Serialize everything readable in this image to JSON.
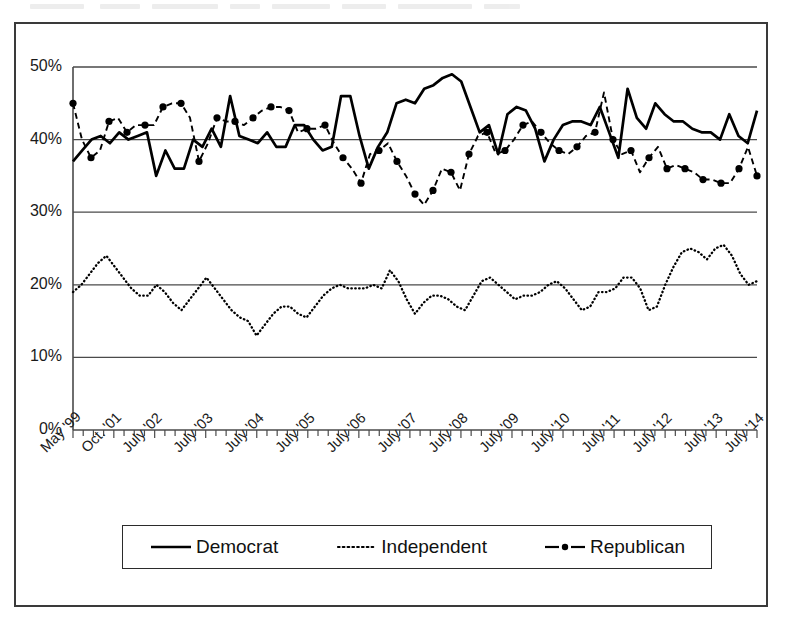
{
  "figure": {
    "frame_color": "#3a3a3a",
    "background": "#ffffff"
  },
  "legend": {
    "position": "bottom",
    "items": [
      {
        "label": "Democrat",
        "style": "solid",
        "marker": "none",
        "color": "#000000",
        "key_name": "legend-key-democrat"
      },
      {
        "label": "Independent",
        "style": "dotted",
        "marker": "none",
        "color": "#000000",
        "key_name": "legend-key-independent"
      },
      {
        "label": "Republican",
        "style": "dashed",
        "marker": "circle",
        "color": "#000000",
        "key_name": "legend-key-republican"
      }
    ]
  },
  "chart_data": {
    "type": "line",
    "title": "",
    "subtitle": "",
    "xlabel": "",
    "ylabel": "",
    "ylim": [
      0,
      50
    ],
    "yticks": [
      0,
      10,
      20,
      30,
      40,
      50
    ],
    "ytick_labels": [
      "0%",
      "10%",
      "20%",
      "30%",
      "40%",
      "50%"
    ],
    "grid": "horizontal",
    "legend_position": "bottom",
    "xtick_labels": [
      "May '99",
      "Oct. '01",
      "July '02",
      "July '03",
      "July '04",
      "July '05",
      "July '06",
      "July '07",
      "July '08",
      "July '09",
      "July '10",
      "July '11",
      "July '12",
      "July '13",
      "July '14"
    ],
    "xtick_indices": [
      0,
      4,
      8,
      13,
      18,
      23,
      28,
      33,
      38,
      43,
      48,
      53,
      58,
      63,
      67
    ],
    "n_points": 68,
    "series": [
      {
        "name": "Democrat",
        "style": "solid",
        "marker": "none",
        "values": [
          37.0,
          38.5,
          40.0,
          40.5,
          39.5,
          41.0,
          40.0,
          40.5,
          41.0,
          35.0,
          38.5,
          36.0,
          36.0,
          40.0,
          39.0,
          41.5,
          39.0,
          46.0,
          40.5,
          40.0,
          39.5,
          41.0,
          39.0,
          39.0,
          42.0,
          42.0,
          40.0,
          38.5,
          39.0,
          46.0,
          46.0,
          40.5,
          36.0,
          39.0,
          41.0,
          45.0,
          45.5,
          45.0,
          47.0,
          47.5,
          48.5,
          49.0,
          48.0,
          44.5,
          41.0,
          42.0,
          38.0,
          43.5,
          44.5,
          44.0,
          41.5,
          37.0,
          40.0,
          42.0,
          42.5,
          42.5,
          42.0,
          44.5,
          41.0,
          37.5,
          47.0,
          43.0,
          41.5,
          45.0,
          43.5,
          42.5,
          42.5,
          41.5,
          41.0,
          41.0,
          40.0,
          43.5,
          40.5,
          39.5,
          44.0
        ]
      },
      {
        "name": "Independent",
        "style": "dotted",
        "marker": "none",
        "values": [
          19.0,
          20.0,
          21.5,
          23.0,
          24.0,
          22.5,
          21.0,
          19.5,
          18.5,
          18.5,
          20.0,
          19.0,
          17.5,
          16.5,
          18.0,
          19.5,
          21.0,
          19.5,
          18.0,
          16.5,
          15.5,
          15.0,
          13.0,
          14.5,
          16.0,
          17.0,
          17.0,
          16.0,
          15.5,
          17.0,
          18.5,
          19.5,
          20.0,
          19.5,
          19.5,
          19.5,
          20.0,
          19.5,
          22.0,
          20.5,
          18.0,
          16.0,
          17.5,
          18.5,
          18.5,
          18.0,
          17.0,
          16.5,
          18.5,
          20.5,
          21.0,
          20.0,
          19.0,
          18.0,
          18.5,
          18.5,
          19.0,
          20.0,
          20.5,
          19.5,
          18.0,
          16.5,
          17.0,
          19.0,
          19.0,
          19.5,
          21.0,
          21.0,
          19.5,
          16.5,
          17.0,
          20.0,
          22.5,
          24.5,
          25.0,
          24.5,
          23.5,
          25.0,
          25.5,
          24.0,
          21.5,
          20.0,
          20.5
        ]
      },
      {
        "name": "Republican",
        "style": "dashed",
        "marker": "circle",
        "values": [
          45.0,
          40.0,
          37.5,
          38.5,
          42.5,
          43.0,
          41.0,
          42.0,
          42.0,
          42.0,
          44.5,
          45.0,
          45.0,
          43.0,
          37.0,
          39.5,
          43.0,
          42.5,
          42.5,
          42.0,
          43.0,
          44.0,
          44.5,
          44.5,
          44.0,
          41.0,
          41.5,
          41.5,
          42.0,
          39.5,
          37.5,
          36.0,
          34.0,
          38.0,
          38.5,
          39.5,
          37.0,
          35.0,
          32.5,
          31.0,
          33.0,
          36.0,
          35.5,
          33.0,
          38.0,
          40.5,
          41.0,
          38.0,
          38.5,
          40.0,
          42.0,
          42.5,
          41.0,
          39.5,
          38.5,
          38.0,
          39.0,
          40.5,
          41.0,
          46.5,
          40.0,
          38.0,
          38.5,
          35.5,
          37.5,
          39.0,
          36.0,
          36.5,
          36.0,
          35.5,
          34.5,
          34.5,
          34.0,
          34.0,
          36.0,
          39.0,
          35.0
        ]
      }
    ]
  }
}
